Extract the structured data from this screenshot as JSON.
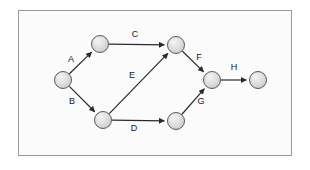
{
  "diagram": {
    "type": "directed-graph",
    "canvas": {
      "width": 310,
      "height": 170
    },
    "frame": {
      "x": 18,
      "y": 10,
      "width": 274,
      "height": 146,
      "border_color": "#9a9a9a",
      "background": "#fbfbfb"
    },
    "style": {
      "node_fill": "#d6d6d6",
      "node_highlight": "#f2f2f2",
      "node_stroke": "#5a5a5a",
      "edge_color": "#2b2b2b",
      "label_color": "#1a1a1a",
      "node_radius": 8.5
    },
    "nodes": [
      {
        "id": "n1",
        "name": "start-node",
        "cx": 63,
        "cy": 80,
        "label": ""
      },
      {
        "id": "n2",
        "name": "upper-left-node",
        "cx": 100,
        "cy": 44,
        "label": ""
      },
      {
        "id": "n3",
        "name": "upper-right-node",
        "cx": 176,
        "cy": 45,
        "label": ""
      },
      {
        "id": "n4",
        "name": "lower-left-node",
        "cx": 103,
        "cy": 120,
        "label": ""
      },
      {
        "id": "n5",
        "name": "lower-right-node",
        "cx": 176,
        "cy": 121,
        "label": ""
      },
      {
        "id": "n6",
        "name": "merge-node",
        "cx": 212,
        "cy": 80,
        "label": ""
      },
      {
        "id": "n7",
        "name": "end-node",
        "cx": 258,
        "cy": 80,
        "label": ""
      }
    ],
    "edges": [
      {
        "id": "e-a",
        "name": "edge-a",
        "label": "A",
        "from": "n1",
        "to": "n2",
        "label_x": 71,
        "label_y": 60
      },
      {
        "id": "e-b",
        "name": "edge-b",
        "label": "B",
        "from": "n1",
        "to": "n4",
        "label_x": 72,
        "label_y": 102
      },
      {
        "id": "e-c",
        "name": "edge-c",
        "label": "C",
        "from": "n2",
        "to": "n3",
        "label_x": 135,
        "label_y": 35
      },
      {
        "id": "e-d",
        "name": "edge-d",
        "label": "D",
        "from": "n4",
        "to": "n5",
        "label_x": 134,
        "label_y": 129
      },
      {
        "id": "e-e",
        "name": "edge-e",
        "label": "E",
        "from": "n4",
        "to": "n3",
        "label_x": 132,
        "label_y": 76
      },
      {
        "id": "e-f",
        "name": "edge-f",
        "label": "F",
        "from": "n3",
        "to": "n6",
        "label_x": 199,
        "label_y": 58
      },
      {
        "id": "e-g",
        "name": "edge-g",
        "label": "G",
        "from": "n5",
        "to": "n6",
        "label_x": 201,
        "label_y": 102
      },
      {
        "id": "e-h",
        "name": "edge-h",
        "label": "H",
        "from": "n6",
        "to": "n7",
        "label_x": 234,
        "label_y": 68
      }
    ]
  }
}
